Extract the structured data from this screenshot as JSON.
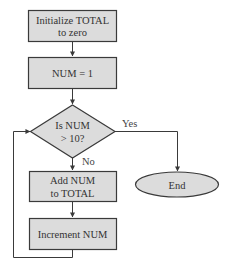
{
  "diagram": {
    "type": "flowchart",
    "colors": {
      "node_fill": "#dcdcdc",
      "node_stroke": "#3a3a3a",
      "edge": "#3a3a3a",
      "text": "#333333"
    },
    "nodes": [
      {
        "id": "init",
        "shape": "rectangle",
        "lines": [
          "Initialize TOTAL",
          "to zero"
        ]
      },
      {
        "id": "num1",
        "shape": "rectangle",
        "lines": [
          "NUM = 1"
        ]
      },
      {
        "id": "check",
        "shape": "diamond",
        "lines": [
          "Is NUM",
          "> 10?"
        ]
      },
      {
        "id": "add",
        "shape": "rectangle",
        "lines": [
          "Add NUM",
          "to TOTAL"
        ]
      },
      {
        "id": "inc",
        "shape": "rectangle",
        "lines": [
          "Increment NUM"
        ]
      },
      {
        "id": "end",
        "shape": "ellipse",
        "lines": [
          "End"
        ]
      }
    ],
    "edges": [
      {
        "from": "init",
        "to": "num1",
        "label": ""
      },
      {
        "from": "num1",
        "to": "check",
        "label": ""
      },
      {
        "from": "check",
        "to": "end",
        "label": "Yes"
      },
      {
        "from": "check",
        "to": "add",
        "label": "No"
      },
      {
        "from": "add",
        "to": "inc",
        "label": ""
      },
      {
        "from": "inc",
        "to": "check",
        "label": ""
      }
    ]
  }
}
